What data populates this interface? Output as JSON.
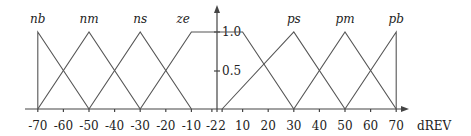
{
  "chart_data": {
    "type": "line",
    "title": "",
    "xlabel": "dREV",
    "ylabel": "",
    "xlim": [
      -70,
      70
    ],
    "ylim": [
      0,
      1.0
    ],
    "grid": false,
    "x_ticks": [
      -70,
      -60,
      -50,
      -40,
      -30,
      -20,
      -10,
      -2,
      2,
      10,
      20,
      30,
      40,
      50,
      60,
      70
    ],
    "x_tick_labels": [
      "-70",
      "-60",
      "-50",
      "-40",
      "-30",
      "-20",
      "-10",
      "-2",
      "2",
      "10",
      "20",
      "30",
      "40",
      "50",
      "60",
      "70"
    ],
    "y_ticks": [
      0.5,
      1.0
    ],
    "y_tick_labels": [
      "0.5",
      "1.0"
    ],
    "series": [
      {
        "name": "nb",
        "x": [
          -70,
          -70,
          -50
        ],
        "y": [
          0,
          1,
          0
        ]
      },
      {
        "name": "nm",
        "x": [
          -70,
          -50,
          -30
        ],
        "y": [
          0,
          1,
          0
        ]
      },
      {
        "name": "ns",
        "x": [
          -50,
          -30,
          -10
        ],
        "y": [
          0,
          1,
          0
        ]
      },
      {
        "name": "ze",
        "x": [
          -30,
          -10,
          10,
          30
        ],
        "y": [
          0,
          1,
          1,
          0
        ]
      },
      {
        "name": "ps",
        "x": [
          2,
          30,
          50
        ],
        "y": [
          0,
          1,
          0
        ]
      },
      {
        "name": "pm",
        "x": [
          30,
          50,
          70
        ],
        "y": [
          0,
          1,
          0
        ]
      },
      {
        "name": "pb",
        "x": [
          50,
          70,
          70
        ],
        "y": [
          0,
          1,
          0
        ]
      }
    ],
    "legend": [
      "nb",
      "nm",
      "ns",
      "ze",
      "ps",
      "pm",
      "pb"
    ]
  }
}
